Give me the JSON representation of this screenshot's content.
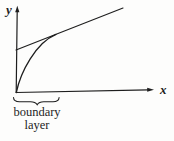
{
  "figure": {
    "y_axis_label": "y",
    "x_axis_label": "x",
    "caption": {
      "line1": "boundary",
      "line2": "layer"
    }
  },
  "colors": {
    "background": "#fdfdfc",
    "ink": "#1e1e1e"
  }
}
